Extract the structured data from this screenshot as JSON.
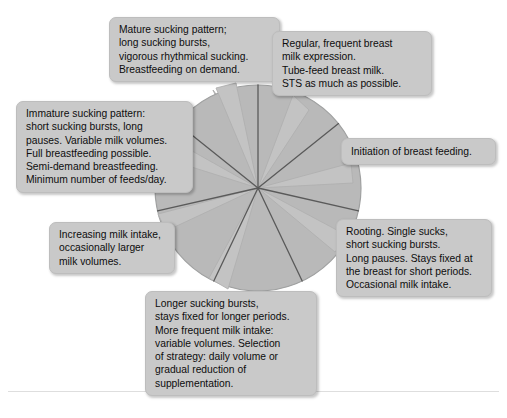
{
  "figure": {
    "type": "radial-wheel-diagram",
    "sectors": 7,
    "colors": {
      "background": "#ffffff",
      "wheel_fill": "#b9b9b9",
      "wheel_edge": "#9a9a9a",
      "spoke_line": "#5a5a5a",
      "callout_fill": "#c9c9c9",
      "callout_border": "#bdbdbd",
      "pointer_fill": "#c3c3c3",
      "text": "#0d0d0d",
      "divider": "#dedede"
    }
  },
  "callouts": {
    "mature": "Mature sucking pattern;\nlong sucking bursts,\nvigorous rhythmical sucking.\nBreastfeeding on demand.",
    "regular": "Regular, frequent breast\nmilk expression.\nTube-feed breast milk.\nSTS as much as possible.",
    "immature": "Immature sucking pattern:\nshort sucking bursts, long\npauses. Variable milk volumes.\nFull breastfeeding possible.\nSemi-demand breastfeeding.\nMinimum number of feeds/day.",
    "initiation": "Initiation of breast feeding.",
    "rooting": "Rooting. Single sucks,\nshort sucking bursts.\nLong pauses. Stays fixed at\nthe breast for short periods.\nOccasional milk intake.",
    "increasing": "Increasing milk intake,\noccasionally larger\nmilk volumes.",
    "longer": "Longer sucking bursts,\nstays fixed for longer periods.\nMore frequent milk intake:\nvariable volumes. Selection\nof strategy: daily volume or\ngradual reduction of\nsupplementation."
  }
}
